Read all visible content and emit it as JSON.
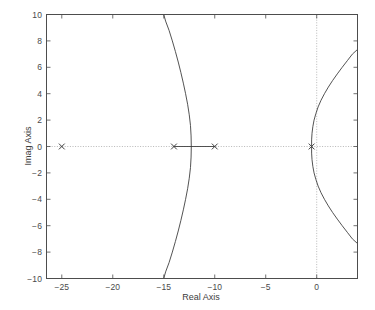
{
  "chart_data": {
    "type": "line",
    "title": "",
    "xlabel": "Real Axis",
    "ylabel": "Imag Axis",
    "xlim": [
      -26.5,
      4.0
    ],
    "ylim": [
      -10,
      10
    ],
    "xticks": [
      -25,
      -20,
      -15,
      -10,
      -5,
      0
    ],
    "xtick_labels": [
      "−25",
      "−20",
      "−15",
      "−10",
      "−5",
      "0"
    ],
    "yticks": [
      10,
      8,
      6,
      4,
      2,
      0,
      -2,
      -4,
      -6,
      -8,
      -10
    ],
    "ytick_labels": [
      "10",
      "8",
      "6",
      "4",
      "2",
      "0",
      "−2",
      "−4",
      "−6",
      "−8",
      "−10"
    ],
    "grid": false,
    "zero_lines": true,
    "legend": "none",
    "line_color": "#404040",
    "axis_color": "#4d4d4d",
    "grid_color": "#9a9a9a",
    "background": "#ffffff",
    "marker_symbol": "x",
    "poles": [
      {
        "re": -25.0,
        "im": 0.0,
        "label": "pole-1"
      },
      {
        "re": -14.0,
        "im": 0.0,
        "label": "pole-2"
      },
      {
        "re": -10.0,
        "im": 0.0,
        "label": "pole-3"
      },
      {
        "re": -0.5,
        "im": 0.0,
        "label": "pole-4"
      }
    ],
    "zeros": [],
    "series": [
      {
        "name": "real-axis-segment",
        "points": [
          [
            -14.0,
            0.0
          ],
          [
            -10.0,
            0.0
          ]
        ]
      },
      {
        "name": "left-branch-upper",
        "points": [
          [
            -12.3,
            0.0
          ],
          [
            -12.32,
            0.8
          ],
          [
            -12.38,
            1.6
          ],
          [
            -12.5,
            2.4
          ],
          [
            -12.66,
            3.2
          ],
          [
            -12.86,
            4.0
          ],
          [
            -13.08,
            4.8
          ],
          [
            -13.32,
            5.6
          ],
          [
            -13.58,
            6.4
          ],
          [
            -13.86,
            7.2
          ],
          [
            -14.16,
            8.0
          ],
          [
            -14.48,
            8.8
          ],
          [
            -14.82,
            9.5
          ],
          [
            -15.0,
            10.0
          ]
        ]
      },
      {
        "name": "left-branch-lower",
        "points": [
          [
            -12.3,
            0.0
          ],
          [
            -12.32,
            -0.8
          ],
          [
            -12.38,
            -1.6
          ],
          [
            -12.5,
            -2.4
          ],
          [
            -12.66,
            -3.2
          ],
          [
            -12.86,
            -4.0
          ],
          [
            -13.08,
            -4.8
          ],
          [
            -13.32,
            -5.6
          ],
          [
            -13.58,
            -6.4
          ],
          [
            -13.86,
            -7.2
          ],
          [
            -14.16,
            -8.0
          ],
          [
            -14.48,
            -8.8
          ],
          [
            -14.82,
            -9.5
          ],
          [
            -15.0,
            -10.0
          ]
        ]
      },
      {
        "name": "right-branch-upper",
        "points": [
          [
            -0.5,
            0.0
          ],
          [
            -0.5,
            0.5
          ],
          [
            -0.46,
            1.0
          ],
          [
            -0.38,
            1.5
          ],
          [
            -0.26,
            2.0
          ],
          [
            -0.08,
            2.5
          ],
          [
            0.14,
            3.0
          ],
          [
            0.42,
            3.5
          ],
          [
            0.76,
            4.0
          ],
          [
            1.14,
            4.5
          ],
          [
            1.56,
            5.0
          ],
          [
            2.02,
            5.5
          ],
          [
            2.5,
            6.0
          ],
          [
            3.0,
            6.5
          ],
          [
            3.5,
            7.0
          ],
          [
            4.0,
            7.35
          ]
        ]
      },
      {
        "name": "right-branch-lower",
        "points": [
          [
            -0.5,
            0.0
          ],
          [
            -0.5,
            -0.5
          ],
          [
            -0.46,
            -1.0
          ],
          [
            -0.38,
            -1.5
          ],
          [
            -0.26,
            -2.0
          ],
          [
            -0.08,
            -2.5
          ],
          [
            0.14,
            -3.0
          ],
          [
            0.42,
            -3.5
          ],
          [
            0.76,
            -4.0
          ],
          [
            1.14,
            -4.5
          ],
          [
            1.56,
            -5.0
          ],
          [
            2.02,
            -5.5
          ],
          [
            2.5,
            -6.0
          ],
          [
            3.0,
            -6.5
          ],
          [
            3.5,
            -7.0
          ],
          [
            4.0,
            -7.35
          ]
        ]
      }
    ]
  }
}
